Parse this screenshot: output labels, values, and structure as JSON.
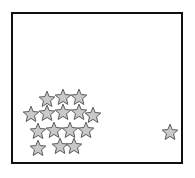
{
  "figure": {
    "type": "scatter",
    "title": "",
    "background_color": "#ffffff",
    "frame": {
      "name": "plot-border",
      "x": 11,
      "y": 12,
      "width": 172,
      "height": 152,
      "border_color": "#111111",
      "border_width": 2,
      "fill_color": "#ffffff"
    },
    "marker": {
      "shape": "star",
      "points": 5,
      "fill_color": "#c9c9c9",
      "stroke_color": "#5a5a5a",
      "stroke_width": 1,
      "size": 17
    },
    "counts": {
      "total_stars": 16,
      "cluster_stars": 15,
      "isolated_stars": 1
    }
  },
  "chart_data": {
    "type": "scatter",
    "title": "",
    "xlabel": "",
    "ylabel": "",
    "xlim": [
      11,
      183
    ],
    "ylim": [
      12,
      164
    ],
    "grid": false,
    "legend": null,
    "series": [
      {
        "name": "cluster",
        "marker": "star",
        "color": "#c9c9c9",
        "count": 15,
        "x": [
          47,
          63,
          79,
          31,
          47,
          63,
          79,
          93,
          38,
          54,
          70,
          86,
          38,
          60,
          74
        ],
        "y": [
          99,
          97,
          97,
          114,
          113,
          112,
          112,
          115,
          131,
          130,
          130,
          130,
          148,
          146,
          146
        ]
      },
      {
        "name": "isolated",
        "marker": "star",
        "color": "#c9c9c9",
        "count": 1,
        "x": [
          170
        ],
        "y": [
          132
        ]
      }
    ]
  }
}
